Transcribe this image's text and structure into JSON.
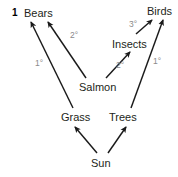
{
  "figure": {
    "number": "1",
    "type": "food-web-diagram"
  },
  "colors": {
    "arrow": "#1a1a1a",
    "node_text": "#231f20",
    "level_text": "#8a8a8a",
    "background": "#ffffff"
  },
  "nodes": [
    {
      "id": "bears",
      "label": "Bears",
      "x": 24,
      "y": 7
    },
    {
      "id": "birds",
      "label": "Birds",
      "x": 147,
      "y": 5
    },
    {
      "id": "insects",
      "label": "Insects",
      "x": 112,
      "y": 38
    },
    {
      "id": "salmon",
      "label": "Salmon",
      "x": 79,
      "y": 81
    },
    {
      "id": "grass",
      "label": "Grass",
      "x": 61,
      "y": 111
    },
    {
      "id": "trees",
      "label": "Trees",
      "x": 109,
      "y": 111
    },
    {
      "id": "sun",
      "label": "Sun",
      "x": 91,
      "y": 157
    }
  ],
  "levels": [
    {
      "id": "grass-bears",
      "label": "2°",
      "x": 70,
      "y": 31
    },
    {
      "id": "salmon-bears",
      "label": "1°",
      "x": 35,
      "y": 59
    },
    {
      "id": "salmon-insects",
      "label": "2°",
      "x": 116,
      "y": 61
    },
    {
      "id": "trees-birds",
      "label": "1°",
      "x": 153,
      "y": 57
    },
    {
      "id": "insects-birds",
      "label": "3°",
      "x": 129,
      "y": 20
    }
  ],
  "edges": [
    {
      "id": "grass-to-bears",
      "from": "Grass",
      "to": "Bears",
      "level": "1°",
      "x1": 73,
      "y1": 108,
      "x2": 31,
      "y2": 22
    },
    {
      "id": "salmon-to-bears",
      "from": "Salmon",
      "to": "Bears",
      "level": "2°",
      "x1": 86,
      "y1": 78,
      "x2": 48,
      "y2": 22
    },
    {
      "id": "salmon-to-insects",
      "from": "Salmon",
      "to": "Insects",
      "level": "2°",
      "x1": 106,
      "y1": 78,
      "x2": 129,
      "y2": 52
    },
    {
      "id": "insects-to-birds",
      "from": "Insects",
      "to": "Birds",
      "level": "3°",
      "x1": 137,
      "y1": 33,
      "x2": 152,
      "y2": 20
    },
    {
      "id": "trees-to-birds",
      "from": "Trees",
      "to": "Birds",
      "level": "1°",
      "x1": 131,
      "y1": 108,
      "x2": 163,
      "y2": 20
    },
    {
      "id": "sun-to-grass",
      "from": "Sun",
      "to": "Grass",
      "level": "",
      "x1": 97,
      "y1": 153,
      "x2": 75,
      "y2": 127
    },
    {
      "id": "sun-to-trees",
      "from": "Sun",
      "to": "Trees",
      "level": "",
      "x1": 108,
      "y1": 153,
      "x2": 126,
      "y2": 127
    }
  ]
}
